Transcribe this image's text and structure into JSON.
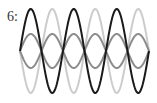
{
  "figure": {
    "label": "6:",
    "center_y": 51,
    "x_start": 20,
    "x_end": 149,
    "periods": 3,
    "waves": [
      {
        "name": "light-gray-large",
        "color": "#cccccc",
        "amplitude": 42,
        "phase": "inverted",
        "stroke_width": 2
      },
      {
        "name": "medium-gray-upper",
        "color": "#8c8c8c",
        "amplitude": 17,
        "phase": "normal",
        "stroke_width": 2
      },
      {
        "name": "medium-gray-lower",
        "color": "#8c8c8c",
        "amplitude": 17,
        "phase": "inverted",
        "stroke_width": 2
      },
      {
        "name": "black-large",
        "color": "#1a1a1a",
        "amplitude": 42,
        "phase": "normal",
        "stroke_width": 2
      }
    ]
  }
}
